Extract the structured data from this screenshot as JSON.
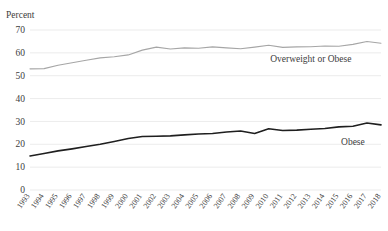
{
  "chart_data": {
    "type": "line",
    "title": "",
    "ylabel": "Percent",
    "xlabel": "",
    "ylim": [
      0,
      70
    ],
    "yticks": [
      0,
      10,
      20,
      30,
      40,
      50,
      60,
      70
    ],
    "ytick_labels": [
      "0",
      "10",
      "20",
      "30",
      "40",
      "50",
      "60",
      "70"
    ],
    "grid": true,
    "legend_position": "inline-annotation",
    "categories": [
      "1993",
      "1994",
      "1995",
      "1996",
      "1997",
      "1998",
      "1999",
      "2000",
      "2001",
      "2002",
      "2003",
      "2004",
      "2005",
      "2006",
      "2007",
      "2008",
      "2009",
      "2010",
      "2011",
      "2012",
      "2013",
      "2014",
      "2015",
      "2016",
      "2017",
      "2018"
    ],
    "series": [
      {
        "name": "Overweight or Obese",
        "color": "#a6a6a6",
        "values": [
          53.0,
          53.1,
          54.6,
          55.7,
          56.8,
          57.8,
          58.3,
          59.1,
          61.2,
          62.5,
          61.7,
          62.2,
          62.0,
          62.6,
          62.2,
          61.8,
          62.5,
          63.3,
          62.4,
          62.6,
          62.7,
          63.0,
          62.9,
          63.7,
          65.0,
          64.2
        ],
        "label_x_category": "2013",
        "label_value": 56.0
      },
      {
        "name": "Obese",
        "color": "#1f1f1f",
        "values": [
          14.9,
          16.0,
          17.1,
          18.0,
          19.0,
          20.0,
          21.2,
          22.5,
          23.4,
          23.5,
          23.7,
          24.1,
          24.5,
          24.7,
          25.4,
          25.8,
          24.7,
          26.8,
          26.0,
          26.2,
          26.6,
          26.9,
          27.6,
          27.9,
          29.3,
          28.5
        ],
        "label_x_category": "2016",
        "label_value": 19.5
      }
    ]
  },
  "plot": {
    "left_px": 30,
    "right_px": 381,
    "top_px": 30,
    "bottom_px": 190,
    "axis_title_x": 6,
    "axis_title_y": 18
  }
}
